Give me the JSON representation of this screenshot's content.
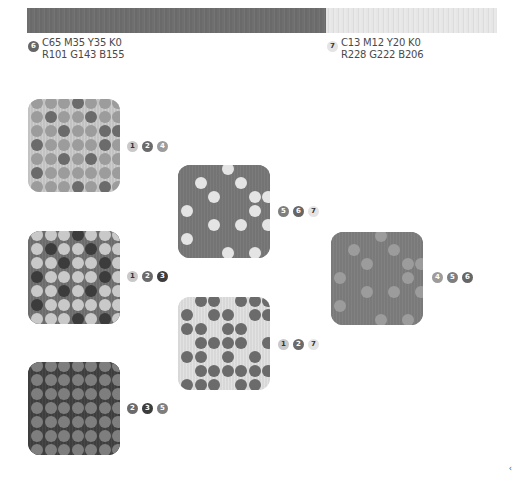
{
  "palette": {
    "1": {
      "hex": "#c9c9c9",
      "text": "dark"
    },
    "2": {
      "hex": "#6b6b6b",
      "text": "light"
    },
    "3": {
      "hex": "#3c3c3c",
      "text": "light"
    },
    "4": {
      "hex": "#9c9c9c",
      "text": "light"
    },
    "5": {
      "hex": "#7e7e7e",
      "text": "light"
    },
    "6": {
      "hex": "#666666",
      "text": "light"
    },
    "7": {
      "hex": "#e4e4e4",
      "text": "dark"
    }
  },
  "color_bar": {
    "left": {
      "badge": "6",
      "cmyk": "C65 M35 Y35 K0",
      "rgb": "R101 G143 B155"
    },
    "right": {
      "badge": "7",
      "cmyk": "C13 M12 Y20 K0",
      "rgb": "R228 G222 B206"
    }
  },
  "swatches": [
    {
      "id": "s1",
      "x": 28,
      "y": 99,
      "bg": "#c2c2c2",
      "stripe": "#cdcdcd",
      "dots": "dense-mixed-a",
      "badges": [
        "1",
        "2",
        "4"
      ],
      "badge_x": 127,
      "badge_y": 141
    },
    {
      "id": "s2",
      "x": 28,
      "y": 231,
      "bg": "#6c6c6c",
      "stripe": "#767676",
      "dots": "dense-mixed-b",
      "badges": [
        "1",
        "2",
        "3"
      ],
      "badge_x": 127,
      "badge_y": 271
    },
    {
      "id": "s3",
      "x": 28,
      "y": 362,
      "bg": "#3e3e3e",
      "stripe": "#474747",
      "dots": "dense-uniform",
      "badges": [
        "2",
        "3",
        "5"
      ],
      "badge_x": 127,
      "badge_y": 403
    },
    {
      "id": "s4",
      "x": 178,
      "y": 165,
      "bg": "#747474",
      "stripe": "#7b7b7b",
      "dots": "sparse-light",
      "badges": [
        "5",
        "6",
        "7"
      ],
      "badge_x": 278,
      "badge_y": 206
    },
    {
      "id": "s5",
      "x": 178,
      "y": 297,
      "bg": "#d8d8d8",
      "stripe": "#e2e2e2",
      "dots": "dense-dark-gaps",
      "badges": [
        "1",
        "2",
        "7"
      ],
      "badge_x": 278,
      "badge_y": 339
    },
    {
      "id": "s6",
      "x": 331,
      "y": 232,
      "bg": "#7a7a7a",
      "stripe": "#818181",
      "dots": "sparse-muted",
      "badges": [
        "4",
        "5",
        "6"
      ],
      "badge_x": 432,
      "badge_y": 272
    }
  ],
  "corner_mark": "‹"
}
